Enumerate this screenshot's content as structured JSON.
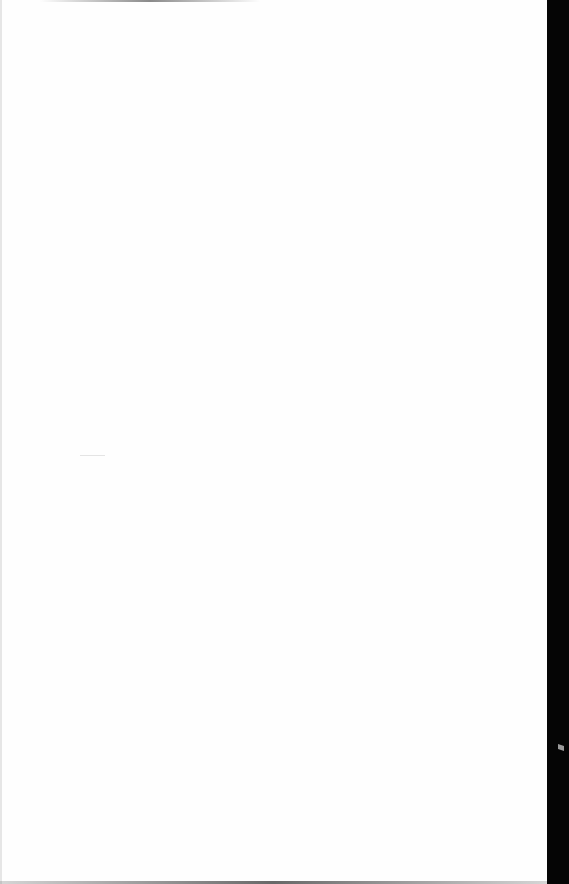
{
  "document": {
    "type": "blank scanned page",
    "visible_text": "",
    "colors": {
      "paper": "#fefefe",
      "scanner_border": "#050505"
    }
  }
}
